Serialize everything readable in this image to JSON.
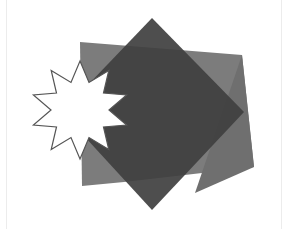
{
  "diagram": {
    "title": "",
    "shapes": [
      {
        "id": "light-quad",
        "kind": "quadrilateral",
        "fill": "#7a7a7a"
      },
      {
        "id": "light-triangle",
        "kind": "triangle",
        "fill": "#6e6e6e"
      },
      {
        "id": "dark-diamond",
        "kind": "diamond",
        "fill": "#444444"
      },
      {
        "id": "star",
        "kind": "star",
        "points": 10,
        "fill": "#ffffff",
        "stroke": "#555555"
      }
    ]
  }
}
